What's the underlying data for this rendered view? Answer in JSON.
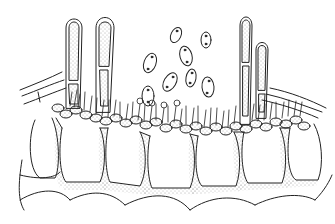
{
  "figure": {
    "background_color": "#ffffff",
    "ink_color": "#222222",
    "stipple_color": "#555555",
    "elements": {
      "elongated_structures": 4,
      "free_spores": 8,
      "cell_rows": 2
    }
  }
}
